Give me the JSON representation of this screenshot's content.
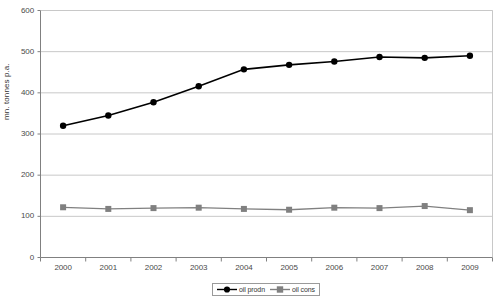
{
  "chart_data": {
    "type": "line",
    "title": "",
    "subtitle": "",
    "xlabel": "",
    "ylabel": "mn. tonnes p.a.",
    "categories": [
      "2000",
      "2001",
      "2002",
      "2003",
      "2004",
      "2005",
      "2006",
      "2007",
      "2008",
      "2009"
    ],
    "x": [
      2000,
      2001,
      2002,
      2003,
      2004,
      2005,
      2006,
      2007,
      2008,
      2009
    ],
    "ylim": [
      0,
      600
    ],
    "yticks": [
      0,
      100,
      200,
      300,
      400,
      500,
      600
    ],
    "ytick_labels": [
      "0",
      "100",
      "200",
      "300",
      "400",
      "500",
      "600"
    ],
    "grid": "horizontal",
    "legend_position": "bottom-center",
    "series": [
      {
        "name": "oil prodn",
        "color": "#000000",
        "marker": "circle",
        "values": [
          320,
          345,
          377,
          416,
          457,
          468,
          476,
          487,
          485,
          490
        ]
      },
      {
        "name": "oil cons",
        "color": "#808080",
        "marker": "square",
        "values": [
          122,
          118,
          120,
          121,
          118,
          116,
          121,
          120,
          125,
          115
        ]
      }
    ]
  },
  "legend": {
    "items": [
      {
        "label": "oil prodn"
      },
      {
        "label": "oil cons"
      }
    ]
  },
  "axes": {
    "y_title": "mn. tonnes p.a."
  },
  "colors": {
    "prodn": "#000000",
    "cons": "#808080",
    "grid": "#c8c8c8",
    "axis": "#808080",
    "plot_border": "#a0a0a0",
    "background": "#ffffff"
  }
}
